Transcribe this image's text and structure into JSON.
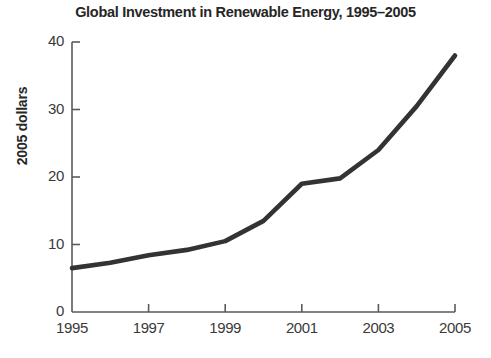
{
  "chart_data": {
    "type": "line",
    "title": "Global Investment in Renewable Energy, 1995–2005",
    "xlabel": "",
    "ylabel": "2005 dollars",
    "x": [
      1995,
      1996,
      1997,
      1998,
      1999,
      2000,
      2001,
      2002,
      2003,
      2004,
      2005
    ],
    "values": [
      6.5,
      7.3,
      8.4,
      9.2,
      10.5,
      13.5,
      19.0,
      19.8,
      24.0,
      30.5,
      38.0
    ],
    "series": [
      {
        "name": "Global investment in renewable energy",
        "values": [
          6.5,
          7.3,
          8.4,
          9.2,
          10.5,
          13.5,
          19.0,
          19.8,
          24.0,
          30.5,
          38.0
        ],
        "color": "#333333"
      }
    ],
    "xlim": [
      1995,
      2005
    ],
    "ylim": [
      0,
      40
    ],
    "xticks": [
      1995,
      1997,
      1999,
      2001,
      2003,
      2005
    ],
    "xtick_labels": [
      "1995",
      "1997",
      "1999",
      "2001",
      "2003",
      "2005"
    ],
    "yticks": [
      0,
      10,
      20,
      30,
      40
    ],
    "ytick_labels": [
      "0",
      "10",
      "20",
      "30",
      "40"
    ],
    "grid": false,
    "legend": "none",
    "line_color": "#333333",
    "axis_color": "#5a5a5a",
    "background": "#ffffff"
  }
}
